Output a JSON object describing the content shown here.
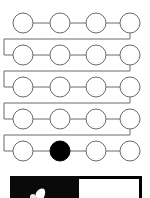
{
  "figure": {
    "title": "Serpentine node chain",
    "node_count": 20,
    "rows": 5,
    "columns": 4,
    "layout": "boustrophedon",
    "node_diameter_px": 20,
    "row_centers_y": [
      23,
      55,
      87,
      119,
      151
    ],
    "column_centers_x": [
      23,
      60,
      96,
      130
    ],
    "stroke_color": "#6b6b6b",
    "node_fill_default": "#ffffff",
    "node_fill_highlight": "#000000",
    "background": "#ffffff"
  },
  "chart_data": {
    "type": "diagram",
    "title": "Serpentine node chain",
    "nodes": [
      {
        "id": 1,
        "row": 1,
        "col": 1,
        "cx": 23,
        "cy": 23,
        "state": "open"
      },
      {
        "id": 2,
        "row": 1,
        "col": 2,
        "cx": 60,
        "cy": 23,
        "state": "open"
      },
      {
        "id": 3,
        "row": 1,
        "col": 3,
        "cx": 96,
        "cy": 23,
        "state": "open"
      },
      {
        "id": 4,
        "row": 1,
        "col": 4,
        "cx": 130,
        "cy": 23,
        "state": "open"
      },
      {
        "id": 5,
        "row": 2,
        "col": 1,
        "cx": 23,
        "cy": 55,
        "state": "open"
      },
      {
        "id": 6,
        "row": 2,
        "col": 2,
        "cx": 60,
        "cy": 55,
        "state": "open"
      },
      {
        "id": 7,
        "row": 2,
        "col": 3,
        "cx": 96,
        "cy": 55,
        "state": "open"
      },
      {
        "id": 8,
        "row": 2,
        "col": 4,
        "cx": 130,
        "cy": 55,
        "state": "open"
      },
      {
        "id": 9,
        "row": 3,
        "col": 1,
        "cx": 23,
        "cy": 87,
        "state": "open"
      },
      {
        "id": 10,
        "row": 3,
        "col": 2,
        "cx": 60,
        "cy": 87,
        "state": "open"
      },
      {
        "id": 11,
        "row": 3,
        "col": 3,
        "cx": 96,
        "cy": 87,
        "state": "open"
      },
      {
        "id": 12,
        "row": 3,
        "col": 4,
        "cx": 130,
        "cy": 87,
        "state": "open"
      },
      {
        "id": 13,
        "row": 4,
        "col": 1,
        "cx": 23,
        "cy": 119,
        "state": "open"
      },
      {
        "id": 14,
        "row": 4,
        "col": 2,
        "cx": 60,
        "cy": 119,
        "state": "open"
      },
      {
        "id": 15,
        "row": 4,
        "col": 3,
        "cx": 96,
        "cy": 119,
        "state": "open"
      },
      {
        "id": 16,
        "row": 4,
        "col": 4,
        "cx": 130,
        "cy": 119,
        "state": "open"
      },
      {
        "id": 17,
        "row": 5,
        "col": 1,
        "cx": 23,
        "cy": 151,
        "state": "open"
      },
      {
        "id": 18,
        "row": 5,
        "col": 2,
        "cx": 60,
        "cy": 151,
        "state": "filled"
      },
      {
        "id": 19,
        "row": 5,
        "col": 3,
        "cx": 96,
        "cy": 151,
        "state": "open"
      },
      {
        "id": 20,
        "row": 5,
        "col": 4,
        "cx": 130,
        "cy": 151,
        "state": "open"
      }
    ],
    "intra_row_links": [
      {
        "from": 1,
        "to": 2,
        "x1": 33,
        "x2": 50,
        "y": 23
      },
      {
        "from": 2,
        "to": 3,
        "x1": 70,
        "x2": 86,
        "y": 23
      },
      {
        "from": 3,
        "to": 4,
        "x1": 106,
        "x2": 120,
        "y": 23
      },
      {
        "from": 5,
        "to": 6,
        "x1": 33,
        "x2": 50,
        "y": 55
      },
      {
        "from": 6,
        "to": 7,
        "x1": 70,
        "x2": 86,
        "y": 55
      },
      {
        "from": 7,
        "to": 8,
        "x1": 106,
        "x2": 120,
        "y": 55
      },
      {
        "from": 9,
        "to": 10,
        "x1": 33,
        "x2": 50,
        "y": 87
      },
      {
        "from": 10,
        "to": 11,
        "x1": 70,
        "x2": 86,
        "y": 87
      },
      {
        "from": 11,
        "to": 12,
        "x1": 106,
        "x2": 120,
        "y": 87
      },
      {
        "from": 13,
        "to": 14,
        "x1": 33,
        "x2": 50,
        "y": 119
      },
      {
        "from": 14,
        "to": 15,
        "x1": 70,
        "x2": 86,
        "y": 119
      },
      {
        "from": 15,
        "to": 16,
        "x1": 106,
        "x2": 120,
        "y": 119
      },
      {
        "from": 17,
        "to": 18,
        "x1": 33,
        "x2": 50,
        "y": 151
      },
      {
        "from": 18,
        "to": 19,
        "x1": 70,
        "x2": 86,
        "y": 151
      },
      {
        "from": 19,
        "to": 20,
        "x1": 106,
        "x2": 120,
        "y": 151
      }
    ],
    "wrap_links": [
      {
        "from": 4,
        "to": 5,
        "path": "M130,33 L130,39 L4,39 L4,55 L13,55"
      },
      {
        "from": 8,
        "to": 9,
        "path": "M130,65 L130,71 L4,71 L4,87 L13,87"
      },
      {
        "from": 12,
        "to": 13,
        "path": "M130,97 L130,103 L4,103 L4,119 L13,119"
      },
      {
        "from": 16,
        "to": 17,
        "path": "M130,129 L130,135 L4,135 L4,151 L13,151"
      }
    ],
    "highlight": {
      "node_id": 18,
      "row": 5,
      "col": 2,
      "color": "#000000"
    },
    "legend": [],
    "annotations": []
  },
  "bottom_crop": {
    "description": "cropped top edge of an adjacent figure",
    "x": 10,
    "y": 176,
    "width": 132,
    "height": 22,
    "dark_panel_color": "#0a0a0a",
    "light_panel_color": "#ffffff",
    "border_color": "#000000",
    "dark_panel_width": 69,
    "light_panel_width": 63
  }
}
